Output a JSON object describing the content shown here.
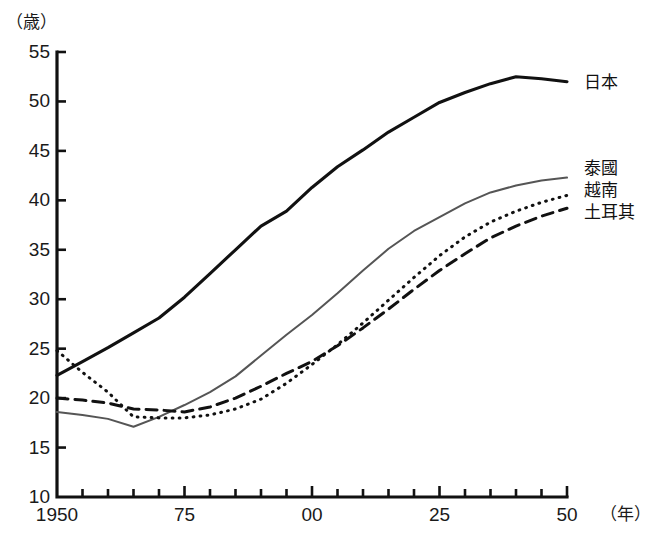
{
  "chart_data": {
    "type": "line",
    "title": "",
    "subtitle": "",
    "xlabel": "（年）",
    "ylabel": "（歳）",
    "ylim": [
      10,
      55
    ],
    "xlim": [
      1950,
      2050
    ],
    "grid": false,
    "legend_position": "right-of-line-ends",
    "y_ticks": [
      10,
      15,
      20,
      25,
      30,
      35,
      40,
      45,
      50,
      55
    ],
    "y_tick_labels": [
      "10",
      "15",
      "20",
      "25",
      "30",
      "35",
      "40",
      "45",
      "50",
      "55"
    ],
    "x_ticks": [
      1950,
      1975,
      2000,
      2025,
      2050
    ],
    "x_tick_labels": [
      "1950",
      "75",
      "00",
      "25",
      "50"
    ],
    "x_minor_tick_step": 5,
    "x": [
      1950,
      1955,
      1960,
      1965,
      1970,
      1975,
      1980,
      1985,
      1990,
      1995,
      2000,
      2005,
      2010,
      2015,
      2020,
      2025,
      2030,
      2035,
      2040,
      2045,
      2050
    ],
    "series": [
      {
        "name": "日本",
        "style": "solid",
        "color": "#111111",
        "width": 3.1,
        "values": [
          22.3,
          23.7,
          25.1,
          26.6,
          28.1,
          30.2,
          32.6,
          35.0,
          37.4,
          38.9,
          41.3,
          43.4,
          45.1,
          46.9,
          48.4,
          49.9,
          50.9,
          51.8,
          52.5,
          52.3,
          52.0
        ]
      },
      {
        "name": "泰國",
        "style": "solid",
        "color": "#555555",
        "width": 2.0,
        "values": [
          18.6,
          18.3,
          17.9,
          17.1,
          18.1,
          19.3,
          20.6,
          22.2,
          24.3,
          26.4,
          28.4,
          30.6,
          32.9,
          35.1,
          36.9,
          38.3,
          39.7,
          40.8,
          41.5,
          42.0,
          42.3
        ]
      },
      {
        "name": "越南",
        "style": "dotted",
        "color": "#111111",
        "width": 3.0,
        "values": [
          24.8,
          22.6,
          20.6,
          18.1,
          18.0,
          18.0,
          18.3,
          18.9,
          19.9,
          21.5,
          23.4,
          25.4,
          27.6,
          29.9,
          32.2,
          34.4,
          36.3,
          37.8,
          38.9,
          39.8,
          40.5
        ]
      },
      {
        "name": "土耳其",
        "style": "dashed",
        "color": "#111111",
        "width": 3.0,
        "values": [
          20.0,
          19.8,
          19.5,
          18.9,
          18.8,
          18.6,
          19.1,
          20.0,
          21.2,
          22.5,
          23.7,
          25.3,
          27.1,
          29.0,
          31.0,
          32.9,
          34.6,
          36.2,
          37.4,
          38.4,
          39.2
        ]
      }
    ]
  },
  "labels": {
    "japan": "日本",
    "thailand": "泰國",
    "vietnam": "越南",
    "turkey": "土耳其"
  }
}
